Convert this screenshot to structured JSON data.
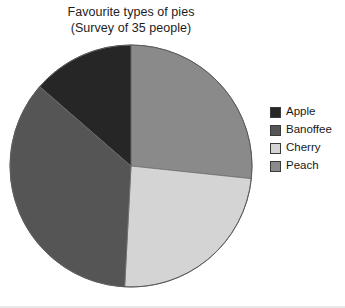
{
  "title": {
    "line1": "Favourite types of pies",
    "line2": "(Survey of 35 people)"
  },
  "legend": {
    "items": [
      {
        "label": "Apple",
        "color": "#262626",
        "swatch_name": "legend-swatch-apple"
      },
      {
        "label": "Banoffee",
        "color": "#555555",
        "swatch_name": "legend-swatch-banoffee"
      },
      {
        "label": "Cherry",
        "color": "#d4d4d4",
        "swatch_name": "legend-swatch-cherry"
      },
      {
        "label": "Peach",
        "color": "#8a8a8a",
        "swatch_name": "legend-swatch-peach"
      }
    ]
  },
  "chart_data": {
    "type": "pie",
    "title": "Favourite types of pies",
    "subtitle": "(Survey of 35 people)",
    "total": 35,
    "units": "people",
    "categories": [
      "Apple",
      "Banoffee",
      "Cherry",
      "Peach"
    ],
    "values": [
      5,
      13,
      8,
      9
    ],
    "percentages": [
      14.3,
      37.1,
      22.9,
      25.7
    ],
    "colors": [
      "#262626",
      "#555555",
      "#d4d4d4",
      "#8a8a8a"
    ],
    "start_angle_deg": 0,
    "direction": "clockwise",
    "slice_angles_deg": [
      49,
      128,
      87,
      96
    ],
    "slice_boundaries_deg": [
      {
        "name": "Peach",
        "start": 0,
        "end": 96
      },
      {
        "name": "Cherry",
        "start": 96,
        "end": 183
      },
      {
        "name": "Banoffee",
        "start": 183,
        "end": 311
      },
      {
        "name": "Apple",
        "start": 311,
        "end": 360
      }
    ],
    "legend_position": "right",
    "grid": false,
    "xlabel": "",
    "ylabel": ""
  },
  "geometry": {
    "center_x": 131,
    "center_y": 166,
    "radius": 121
  }
}
